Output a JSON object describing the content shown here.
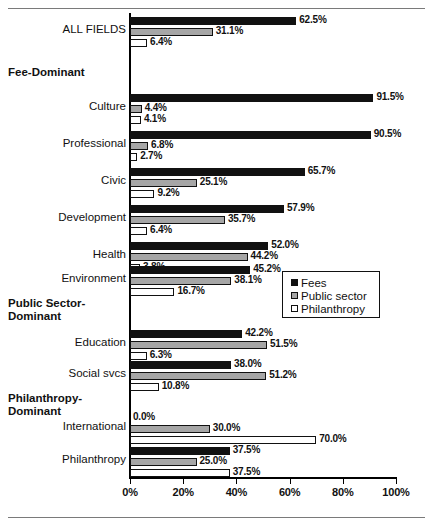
{
  "chart_data": {
    "type": "bar",
    "orientation": "horizontal",
    "title": "",
    "xlabel": "",
    "ylabel": "",
    "xlim": [
      0,
      100
    ],
    "xticks": [
      "0%",
      "20%",
      "40%",
      "60%",
      "80%",
      "100%"
    ],
    "xtick_values": [
      0,
      20,
      40,
      60,
      80,
      100
    ],
    "grid": false,
    "legend_position": "middle-right",
    "series": [
      {
        "name": "Fees",
        "color": "#111111"
      },
      {
        "name": "Public sector",
        "color": "#a6a6a6"
      },
      {
        "name": "Philanthropy",
        "color": "#ffffff"
      }
    ],
    "categories": [
      "ALL FIELDS",
      "Culture",
      "Professional",
      "Civic",
      "Development",
      "Health",
      "Environment",
      "Education",
      "Social svcs",
      "International",
      "Philanthropy"
    ],
    "values": {
      "Fees": [
        62.5,
        91.5,
        90.5,
        65.7,
        57.9,
        52.0,
        45.2,
        42.2,
        38.0,
        0.0,
        37.5
      ],
      "Public sector": [
        31.1,
        4.4,
        6.8,
        25.1,
        35.7,
        44.2,
        38.1,
        51.5,
        51.2,
        30.0,
        25.0
      ],
      "Philanthropy": [
        6.4,
        4.1,
        2.7,
        9.2,
        6.4,
        3.8,
        16.7,
        6.3,
        10.8,
        70.0,
        37.5
      ]
    },
    "section_headers": [
      "Fee-Dominant",
      "Public Sector-Dominant",
      "Philanthropy-Dominant"
    ]
  },
  "legend": {
    "items": [
      {
        "label": "Fees",
        "swatch": "black-square-icon"
      },
      {
        "label": "Public sector",
        "swatch": "gray-square-icon"
      },
      {
        "label": "Philanthropy",
        "swatch": "white-square-icon"
      }
    ]
  },
  "axis": {
    "ticks": [
      {
        "label": "0%",
        "value": 0
      },
      {
        "label": "20%",
        "value": 20
      },
      {
        "label": "40%",
        "value": 40
      },
      {
        "label": "60%",
        "value": 60
      },
      {
        "label": "80%",
        "value": 80
      },
      {
        "label": "100%",
        "value": 100
      }
    ]
  },
  "rows": [
    {
      "kind": "group",
      "label": "ALL FIELDS",
      "top": 17,
      "bars": [
        {
          "series": "Fees",
          "value": 62.5,
          "label": "62.5%"
        },
        {
          "series": "Public sector",
          "value": 31.1,
          "label": "31.1%"
        },
        {
          "series": "Philanthropy",
          "value": 6.4,
          "label": "6.4%"
        }
      ]
    },
    {
      "kind": "section",
      "label": "Fee-Dominant",
      "top": 66
    },
    {
      "kind": "group",
      "label": "Culture",
      "top": 94,
      "bars": [
        {
          "series": "Fees",
          "value": 91.5,
          "label": "91.5%"
        },
        {
          "series": "Public sector",
          "value": 4.4,
          "label": "4.4%"
        },
        {
          "series": "Philanthropy",
          "value": 4.1,
          "label": "4.1%"
        }
      ]
    },
    {
      "kind": "group",
      "label": "Professional",
      "top": 131,
      "bars": [
        {
          "series": "Fees",
          "value": 90.5,
          "label": "90.5%"
        },
        {
          "series": "Public sector",
          "value": 6.8,
          "label": "6.8%"
        },
        {
          "series": "Philanthropy",
          "value": 2.7,
          "label": "2.7%"
        }
      ]
    },
    {
      "kind": "group",
      "label": "Civic",
      "top": 168,
      "bars": [
        {
          "series": "Fees",
          "value": 65.7,
          "label": "65.7%"
        },
        {
          "series": "Public sector",
          "value": 25.1,
          "label": "25.1%"
        },
        {
          "series": "Philanthropy",
          "value": 9.2,
          "label": "9.2%"
        }
      ]
    },
    {
      "kind": "group",
      "label": "Development",
      "top": 205,
      "bars": [
        {
          "series": "Fees",
          "value": 57.9,
          "label": "57.9%"
        },
        {
          "series": "Public sector",
          "value": 35.7,
          "label": "35.7%"
        },
        {
          "series": "Philanthropy",
          "value": 6.4,
          "label": "6.4%"
        }
      ]
    },
    {
      "kind": "group",
      "label": "Health",
      "top": 242,
      "bars": [
        {
          "series": "Fees",
          "value": 52.0,
          "label": "52.0%"
        },
        {
          "series": "Public sector",
          "value": 44.2,
          "label": "44.2%"
        },
        {
          "series": "Philanthropy",
          "value": 3.8,
          "label": "3.8%"
        }
      ]
    },
    {
      "kind": "group",
      "label": "Environment",
      "top": 266,
      "bars": [
        {
          "series": "Fees",
          "value": 45.2,
          "label": "45.2%"
        },
        {
          "series": "Public sector",
          "value": 38.1,
          "label": "38.1%"
        },
        {
          "series": "Philanthropy",
          "value": 16.7,
          "label": "16.7%"
        }
      ]
    },
    {
      "kind": "section",
      "label": "Public Sector-Dominant",
      "top": 297
    },
    {
      "kind": "group",
      "label": "Education",
      "top": 330,
      "bars": [
        {
          "series": "Fees",
          "value": 42.2,
          "label": "42.2%"
        },
        {
          "series": "Public sector",
          "value": 51.5,
          "label": "51.5%"
        },
        {
          "series": "Philanthropy",
          "value": 6.3,
          "label": "6.3%"
        }
      ]
    },
    {
      "kind": "group",
      "label": "Social svcs",
      "top": 361,
      "bars": [
        {
          "series": "Fees",
          "value": 38.0,
          "label": "38.0%"
        },
        {
          "series": "Public sector",
          "value": 51.2,
          "label": "51.2%"
        },
        {
          "series": "Philanthropy",
          "value": 10.8,
          "label": "10.8%"
        }
      ]
    },
    {
      "kind": "section",
      "label": "Philanthropy-Dominant",
      "top": 392
    },
    {
      "kind": "group",
      "label": "International",
      "top": 414,
      "bars": [
        {
          "series": "Fees",
          "value": 0.0,
          "label": "0.0%"
        },
        {
          "series": "Public sector",
          "value": 30.0,
          "label": "30.0%"
        },
        {
          "series": "Philanthropy",
          "value": 70.0,
          "label": "70.0%"
        }
      ]
    },
    {
      "kind": "group",
      "label": "Philanthropy",
      "top": 447,
      "bars": [
        {
          "series": "Fees",
          "value": 37.5,
          "label": "37.5%"
        },
        {
          "series": "Public sector",
          "value": 25.0,
          "label": "25.0%"
        },
        {
          "series": "Philanthropy",
          "value": 37.5,
          "label": "37.5%"
        }
      ]
    }
  ]
}
